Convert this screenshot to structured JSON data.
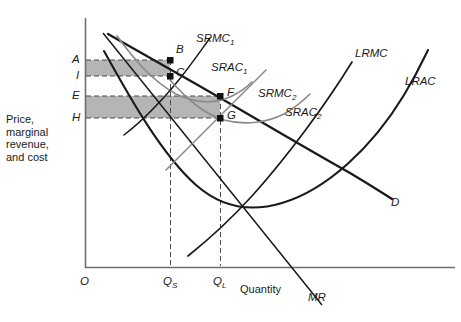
{
  "figure": {
    "axes": {
      "origin_label": "O",
      "y_axis_caption": "Price,\nmarginal\nrevenue,\nand cost",
      "y_axis_caption_lines": [
        "Price,",
        "marginal",
        "revenue,",
        "and cost"
      ],
      "x_axis_label": "Quantity"
    },
    "y_ticks": [
      {
        "label": "A",
        "y": 60
      },
      {
        "label": "I",
        "y": 76
      },
      {
        "label": "E",
        "y": 96
      },
      {
        "label": "H",
        "y": 118
      }
    ],
    "x_ticks": [
      {
        "label": "Q",
        "sub": "S",
        "x": 170
      },
      {
        "label": "Q",
        "sub": "L",
        "x": 220
      }
    ],
    "points": [
      {
        "label": "B",
        "x": 170,
        "y": 60
      },
      {
        "label": "C",
        "x": 170,
        "y": 76
      },
      {
        "label": "F",
        "x": 220,
        "y": 96
      },
      {
        "label": "G",
        "x": 220,
        "y": 118
      }
    ],
    "curves": [
      {
        "name": "SRMC",
        "sub": "1",
        "label": "SRMC1"
      },
      {
        "name": "SRAC",
        "sub": "1",
        "label": "SRAC1"
      },
      {
        "name": "SRMC",
        "sub": "2",
        "label": "SRMC2"
      },
      {
        "name": "SRAC",
        "sub": "2",
        "label": "SRAC2"
      },
      {
        "name": "LRMC",
        "sub": "",
        "label": "LRMC"
      },
      {
        "name": "LRAC",
        "sub": "",
        "label": "LRAC"
      },
      {
        "name": "D",
        "sub": "",
        "label": "D"
      },
      {
        "name": "MR",
        "sub": "",
        "label": "MR"
      }
    ],
    "shaded_regions": [
      {
        "name": "upper-profit-rectangle",
        "top_tick": "A",
        "bottom_tick": "I",
        "right_tick": "QS"
      },
      {
        "name": "lower-profit-rectangle",
        "top_tick": "E",
        "bottom_tick": "H",
        "right_tick": "QL"
      }
    ],
    "colors": {
      "axis": "#6e6e6e",
      "curve": "#1a1a1a",
      "curve_light": "#8a8a8a",
      "shade_fill": "#b5b5b5",
      "dashed": "#4d4d4d",
      "background": "#ffffff"
    }
  }
}
